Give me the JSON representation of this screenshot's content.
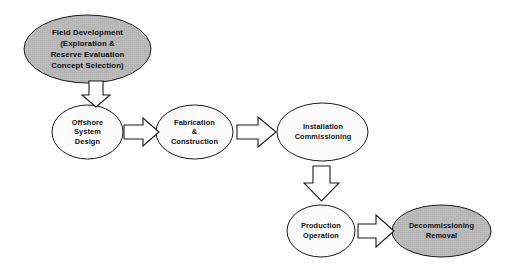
{
  "diagram": {
    "background_color": "#ffffff",
    "stroke_color": "#1a1a1a",
    "text_color": "#111111",
    "fill_shaded": "#b8b8b8",
    "fill_plain": "#fdfdfd",
    "arrow_fill": "#ffffff",
    "nodes": [
      {
        "id": "field-development",
        "label": "Field Development\n(Exploration &\nReserve Evaluation\nConcept Selection)",
        "shape": "ellipse",
        "fill": "shaded",
        "cx": 87.5,
        "cy": 49,
        "rx": 63.5,
        "ry": 34
      },
      {
        "id": "offshore-system-design",
        "label": "Offshore\nSystem\nDesign",
        "shape": "ellipse",
        "fill": "plain",
        "cx": 87.5,
        "cy": 132,
        "rx": 35.5,
        "ry": 27
      },
      {
        "id": "fabrication-construction",
        "label": "Fabrication\n&\nConstruction",
        "shape": "ellipse",
        "fill": "plain",
        "cx": 194.5,
        "cy": 132,
        "rx": 38.5,
        "ry": 27
      },
      {
        "id": "installation-commissioning",
        "label": "Installation\nCommissioning",
        "shape": "ellipse",
        "fill": "plain",
        "cx": 322.5,
        "cy": 132,
        "rx": 45.5,
        "ry": 29
      },
      {
        "id": "production-operation",
        "label": "Production\nOperation",
        "shape": "ellipse",
        "fill": "plain",
        "cx": 321,
        "cy": 231,
        "rx": 34,
        "ry": 26
      },
      {
        "id": "decommissioning-removal",
        "label": "Decommissioning\nRemoval",
        "shape": "ellipse",
        "fill": "shaded",
        "cx": 441.5,
        "cy": 231,
        "rx": 49.5,
        "ry": 26
      }
    ],
    "connectors": [
      {
        "id": "arrow-field-to-offshore",
        "from": "field-development",
        "to": "offshore-system-design",
        "direction": "down"
      },
      {
        "id": "arrow-offshore-to-fabrication",
        "from": "offshore-system-design",
        "to": "fabrication-construction",
        "direction": "right"
      },
      {
        "id": "arrow-fabrication-to-installation",
        "from": "fabrication-construction",
        "to": "installation-commissioning",
        "direction": "right"
      },
      {
        "id": "arrow-installation-to-production",
        "from": "installation-commissioning",
        "to": "production-operation",
        "direction": "down"
      },
      {
        "id": "arrow-production-to-decommissioning",
        "from": "production-operation",
        "to": "decommissioning-removal",
        "direction": "right"
      }
    ]
  }
}
